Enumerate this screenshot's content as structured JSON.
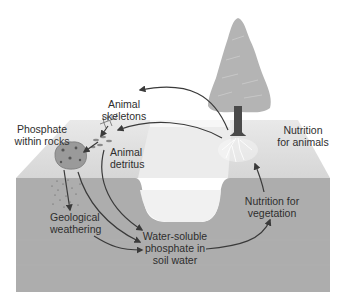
{
  "diagram": {
    "colors": {
      "background": "#ffffff",
      "ground_top": "#e2e2e2",
      "ground_front": "#adadad",
      "trench_water": "#f2f2f2",
      "tree_foliage": "#b4b4b4",
      "tree_trunk": "#4a4a4a",
      "arrow": "#3a3a3a",
      "text": "#2e2e2e"
    },
    "nodes": [
      {
        "id": "animal_skeletons",
        "lines": [
          "Animal",
          "skeletons"
        ]
      },
      {
        "id": "phosphate_rocks",
        "lines": [
          "Phosphate",
          "within rocks"
        ]
      },
      {
        "id": "animal_detritus",
        "lines": [
          "Animal",
          "detritus"
        ]
      },
      {
        "id": "nutrition_animals",
        "lines": [
          "Nutrition",
          "for animals"
        ]
      },
      {
        "id": "geological_weathering",
        "lines": [
          "Geological",
          "weathering"
        ]
      },
      {
        "id": "water_soluble",
        "lines": [
          "Water-soluble",
          "phosphate in",
          "soil water"
        ]
      },
      {
        "id": "nutrition_vegetation",
        "lines": [
          "Nutrition for",
          "vegetation"
        ]
      }
    ],
    "edges": [
      {
        "from": "tree",
        "to": "animal_skeletons"
      },
      {
        "from": "tree",
        "to": "animal_detritus"
      },
      {
        "from": "animal_skeletons",
        "to": "animal_detritus"
      },
      {
        "from": "animal_detritus",
        "to": "phosphate_rocks"
      },
      {
        "from": "animal_detritus",
        "to": "water_soluble"
      },
      {
        "from": "phosphate_rocks",
        "to": "geological_weathering"
      },
      {
        "from": "phosphate_rocks",
        "to": "water_soluble"
      },
      {
        "from": "geological_weathering",
        "to": "water_soluble"
      },
      {
        "from": "water_soluble",
        "to": "nutrition_vegetation"
      },
      {
        "from": "nutrition_vegetation",
        "to": "nutrition_animals"
      }
    ]
  }
}
